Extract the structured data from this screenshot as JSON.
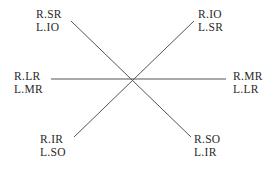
{
  "diagram": {
    "type": "cardinal-positions-of-gaze",
    "line_color": "#555555",
    "text_color": "#2a2a2a",
    "positions": [
      {
        "id": "up-right-viewer-left",
        "line1": "R.SR",
        "line2": "L.IO"
      },
      {
        "id": "up-left-viewer-right",
        "line1": "R.IO",
        "line2": "L.SR"
      },
      {
        "id": "horizontal-left",
        "line1": "R.LR",
        "line2": "L.MR"
      },
      {
        "id": "horizontal-right",
        "line1": "R.MR",
        "line2": "L.LR"
      },
      {
        "id": "down-left",
        "line1": "R.IR",
        "line2": "L.SO"
      },
      {
        "id": "down-right",
        "line1": "R.SO",
        "line2": "L.IR"
      }
    ]
  }
}
